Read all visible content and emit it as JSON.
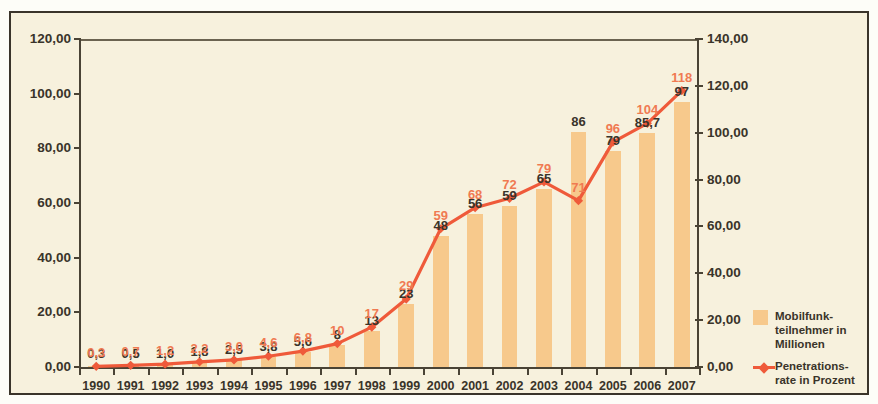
{
  "top_strip": "",
  "chart_data": {
    "type": "bar",
    "title": "",
    "subtitle": "",
    "xlabel": "",
    "ylabel": "",
    "categories": [
      "1990",
      "1991",
      "1992",
      "1993",
      "1994",
      "1995",
      "1996",
      "1997",
      "1998",
      "1999",
      "2000",
      "2001",
      "2002",
      "2003",
      "2004",
      "2005",
      "2006",
      "2007"
    ],
    "series": [
      {
        "name": "Mobilfunkteilnehmer in Millionen",
        "kind": "bar",
        "axis": "left",
        "color": "#f7c98c",
        "values": [
          0.3,
          0.5,
          1.0,
          1.8,
          2.5,
          3.8,
          5.6,
          8,
          13,
          23,
          48,
          56,
          59,
          65,
          86,
          79,
          85.7,
          97
        ],
        "labels": [
          "0,3",
          "0,5",
          "1,0",
          "1,8",
          "2,5",
          "3,8",
          "5,6",
          "8",
          "13",
          "23",
          "48",
          "56",
          "59",
          "65",
          "86",
          "79",
          "85,7",
          "97"
        ]
      },
      {
        "name": "Penetrationsrate in Prozent",
        "kind": "line",
        "axis": "right",
        "color": "#ef5a3a",
        "values": [
          0.3,
          0.7,
          1.2,
          2.2,
          3.0,
          4.6,
          6.8,
          10,
          17,
          29,
          59,
          68,
          72,
          79,
          71,
          96,
          104,
          118
        ],
        "labels": [
          "0,3",
          "0,7",
          "1,2",
          "2,2",
          "3,0",
          "4,6",
          "6,8",
          "10",
          "17",
          "29",
          "59",
          "68",
          "72",
          "79",
          "71",
          "96",
          "104",
          "118"
        ]
      }
    ],
    "yaxis_left": {
      "ticks": [
        0,
        20,
        40,
        60,
        80,
        100,
        120
      ],
      "tick_labels": [
        "0,00",
        "20,00",
        "40,00",
        "60,00",
        "80,00",
        "100,00",
        "120,00"
      ],
      "ylim": [
        0,
        120
      ]
    },
    "yaxis_right": {
      "ticks": [
        0,
        20,
        40,
        60,
        80,
        100,
        120,
        140
      ],
      "tick_labels": [
        "0,00",
        "20,00",
        "40,00",
        "60,00",
        "80,00",
        "100,00",
        "120,00",
        "140,00"
      ],
      "ylim": [
        0,
        140
      ]
    },
    "grid": false,
    "legend_position": "right"
  },
  "legend": {
    "items": [
      {
        "label": "Mobilfunk-\nteilnehmer in\nMillionen",
        "marker": "square",
        "color": "#f7c98c"
      },
      {
        "label": "Penetrations-\nrate in Prozent",
        "marker": "line-diamond",
        "color": "#ef5a3a"
      }
    ]
  }
}
